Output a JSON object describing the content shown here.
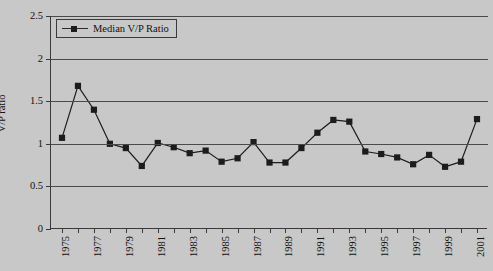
{
  "figure": {
    "background_color": "#c8c8c8",
    "axis_color": "#3a3a3a",
    "series_color": "#1c1c1c"
  },
  "legend": {
    "position": "top-left-inside",
    "entries": [
      {
        "label": "Median V/P Ratio",
        "marker": "filled-square",
        "color": "#1c1c1c"
      }
    ]
  },
  "chart_data": {
    "type": "line",
    "title": "",
    "subtitle": "",
    "xlabel": "",
    "ylabel": "V/P ratio",
    "ylim": [
      0,
      2.5
    ],
    "ytick_labels": [
      "0",
      "0.5",
      "1",
      "1.5",
      "2",
      "2.5"
    ],
    "ytick_values": [
      0,
      0.5,
      1,
      1.5,
      2,
      2.5
    ],
    "grid": true,
    "grid_axis": "y",
    "xlim": [
      1975,
      2001
    ],
    "x": [
      1975,
      1976,
      1977,
      1978,
      1979,
      1980,
      1981,
      1982,
      1983,
      1984,
      1985,
      1986,
      1987,
      1988,
      1989,
      1990,
      1991,
      1992,
      1993,
      1994,
      1995,
      1996,
      1997,
      1998,
      1999,
      2000,
      2001
    ],
    "xtick_labels_shown": [
      "1975",
      "1977",
      "1979",
      "1981",
      "1983",
      "1985",
      "1987",
      "1989",
      "1991",
      "1993",
      "1995",
      "1997",
      "1999",
      "2001"
    ],
    "xtick_labels_rotation": -90,
    "series": [
      {
        "name": "Median V/P Ratio",
        "marker": "filled-square",
        "color": "#1c1c1c",
        "values": [
          1.07,
          1.68,
          1.4,
          1.0,
          0.95,
          0.74,
          1.01,
          0.96,
          0.89,
          0.92,
          0.79,
          0.83,
          1.02,
          0.78,
          0.78,
          0.95,
          1.13,
          1.28,
          1.26,
          0.91,
          0.88,
          0.84,
          0.76,
          0.87,
          0.73,
          0.79,
          1.29
        ]
      }
    ]
  }
}
